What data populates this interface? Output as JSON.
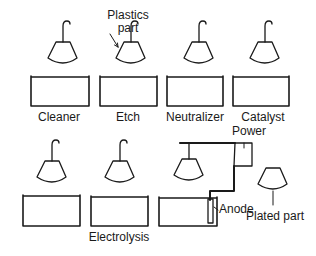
{
  "diagram": {
    "colors": {
      "line": "#1a1a1a",
      "background": "#ffffff"
    },
    "labels": {
      "plastics_part": "Plastics\npart",
      "plastics_part_line1": "Plastics",
      "plastics_part_line2": "part",
      "power": "Power",
      "anode": "Anode",
      "plated_part": "Plated part"
    },
    "stations": [
      {
        "id": "cleaner",
        "label": "Cleaner",
        "row": 1
      },
      {
        "id": "etch",
        "label": "Etch",
        "row": 1
      },
      {
        "id": "neutralizer",
        "label": "Neutralizer",
        "row": 1
      },
      {
        "id": "catalyst",
        "label": "Catalyst",
        "row": 1
      },
      {
        "id": "tank-5",
        "label": "",
        "row": 2
      },
      {
        "id": "electrolysis",
        "label": "Electrolysis",
        "row": 2
      },
      {
        "id": "electroplate",
        "label": "",
        "row": 2
      }
    ]
  }
}
